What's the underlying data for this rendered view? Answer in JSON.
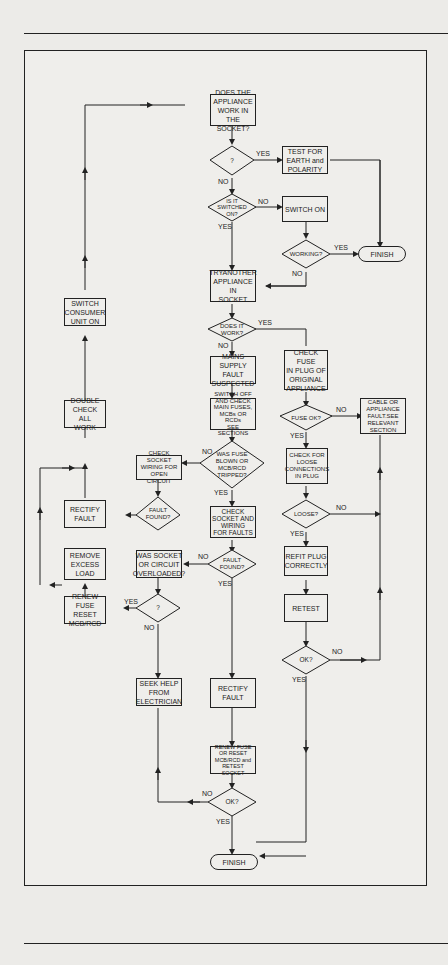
{
  "nodes": {
    "does_appliance_work": "DOES THE\nAPPLIANCE\nWORK IN\nTHE SOCKET?",
    "q1": "?",
    "test_earth": "TEST FOR\nEARTH and\nPOLARITY",
    "is_switched_on": "IS IT\nSWITCHED\nON?",
    "switch_on": "SWITCH ON",
    "working": "WORKING?",
    "finish_top": "FINISH",
    "try_another": "TRYANOTHER\nAPPLIANCE IN\nSOCKET",
    "does_it_work": "DOES IT\nWORK?",
    "check_fuse_plug": "CHECK FUSE\nIN PLUG OF\nORIGINAL\nAPPLIANCE",
    "mains_supply": "MAINS SUPPLY\nFAULT\nSUSPECTED",
    "switch_off_check": "SWITCH OFF\nAND CHECK\nMAIN FUSES,\nMCBs OR RCDs\nSEE SECTIONS",
    "fuse_ok": "FUSE  OK?",
    "cable_fault": "CABLE OR\nAPPLIANCE\nFAULT.SEE\nRELEVANT\nSECTION",
    "switch_consumer": "SWITCH\nCONSUMER\nUNIT ON",
    "double_check": "DOUBLE\nCHECK ALL\nWORK",
    "check_socket_wiring": "CHECK SOCKET\nWIRING FOR\nOPEN CIRCUIT",
    "was_fuse_blown": "WAS FUSE\nBLOWN OR\nMCB/RCD\nTRIPPED?",
    "check_loose": "CHECK FOR\nLOOSE\nCONNECTIONS\nIN PLUG",
    "rectify_fault_left": "RECTIFY\nFAULT",
    "fault_found_1": "FAULT\nFOUND?",
    "check_socket_faults": "CHECK\nSOCKET AND\nWIRING\nFOR FAULTS",
    "loose": "LOOSE?",
    "remove_load": "REMOVE\nEXCESS\nLOAD",
    "was_overloaded": "WAS SOCKET\nOR CIRCUIT\nOVERLOADED?",
    "fault_found_2": "FAULT\nFOUND?",
    "refit_plug": "REFIT PLUG\nCORRECTLY",
    "renew_fuse_reset": "RENEW FUSE\nRESET\nMCB/RCD",
    "q2": "?",
    "retest": "RETEST",
    "ok_right": "OK?",
    "seek_help": "SEEK HELP\nFROM\nELECTRICIAN",
    "rectify_fault_mid": "RECTIFY\nFAULT",
    "renew_retest": "RENEW FUSE\nOR RESET\nMCB/RCD and\nRETEST SOCKET",
    "ok_bottom": "OK?",
    "finish_bottom": "FINISH"
  },
  "labels": {
    "yes": "YES",
    "no": "NO"
  },
  "colors": {
    "line": "#222222",
    "paper": "#efeeeb"
  }
}
